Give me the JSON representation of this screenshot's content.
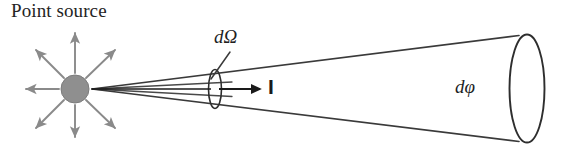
{
  "figure": {
    "background_color": "#ffffff",
    "labels": {
      "point_source": "Point source",
      "solid_angle": "dΩ",
      "flux": "dφ",
      "intensity": "I"
    },
    "colors": {
      "text": "#242424",
      "ray_arrow": "#8a8a8a",
      "cone_line": "#3a3a3a",
      "source_fill": "#8f8f8f",
      "source_stroke": "#7a7a7a",
      "intensity_arrow": "#1a1a1a",
      "leader_line": "#3a3a3a"
    },
    "source": {
      "name": "point-source-dot",
      "cx": 75,
      "cy": 89,
      "r": 14
    },
    "rays": [
      {
        "name": "ray-up",
        "angle_deg": 270,
        "length": 58
      },
      {
        "name": "ray-up-right",
        "angle_deg": 315,
        "length": 55
      },
      {
        "name": "ray-up-left",
        "angle_deg": 225,
        "length": 55
      },
      {
        "name": "ray-left",
        "angle_deg": 180,
        "length": 50
      },
      {
        "name": "ray-down-left",
        "angle_deg": 135,
        "length": 55
      },
      {
        "name": "ray-down",
        "angle_deg": 90,
        "length": 52
      },
      {
        "name": "ray-down-right",
        "angle_deg": 45,
        "length": 55
      }
    ],
    "cone": {
      "apex_x": 92,
      "apex_y": 89,
      "end_x": 519,
      "top_end_y": 36,
      "bottom_end_y": 141,
      "end_ellipse": {
        "cx": 527,
        "cy": 89,
        "rx": 17,
        "ry": 55
      }
    },
    "aperture": {
      "name": "solid-angle-aperture",
      "cx": 215,
      "cy": 89,
      "rx": 6,
      "ry": 19
    },
    "intensity_arrow": {
      "x1": 219,
      "x2": 262,
      "y": 89
    }
  }
}
